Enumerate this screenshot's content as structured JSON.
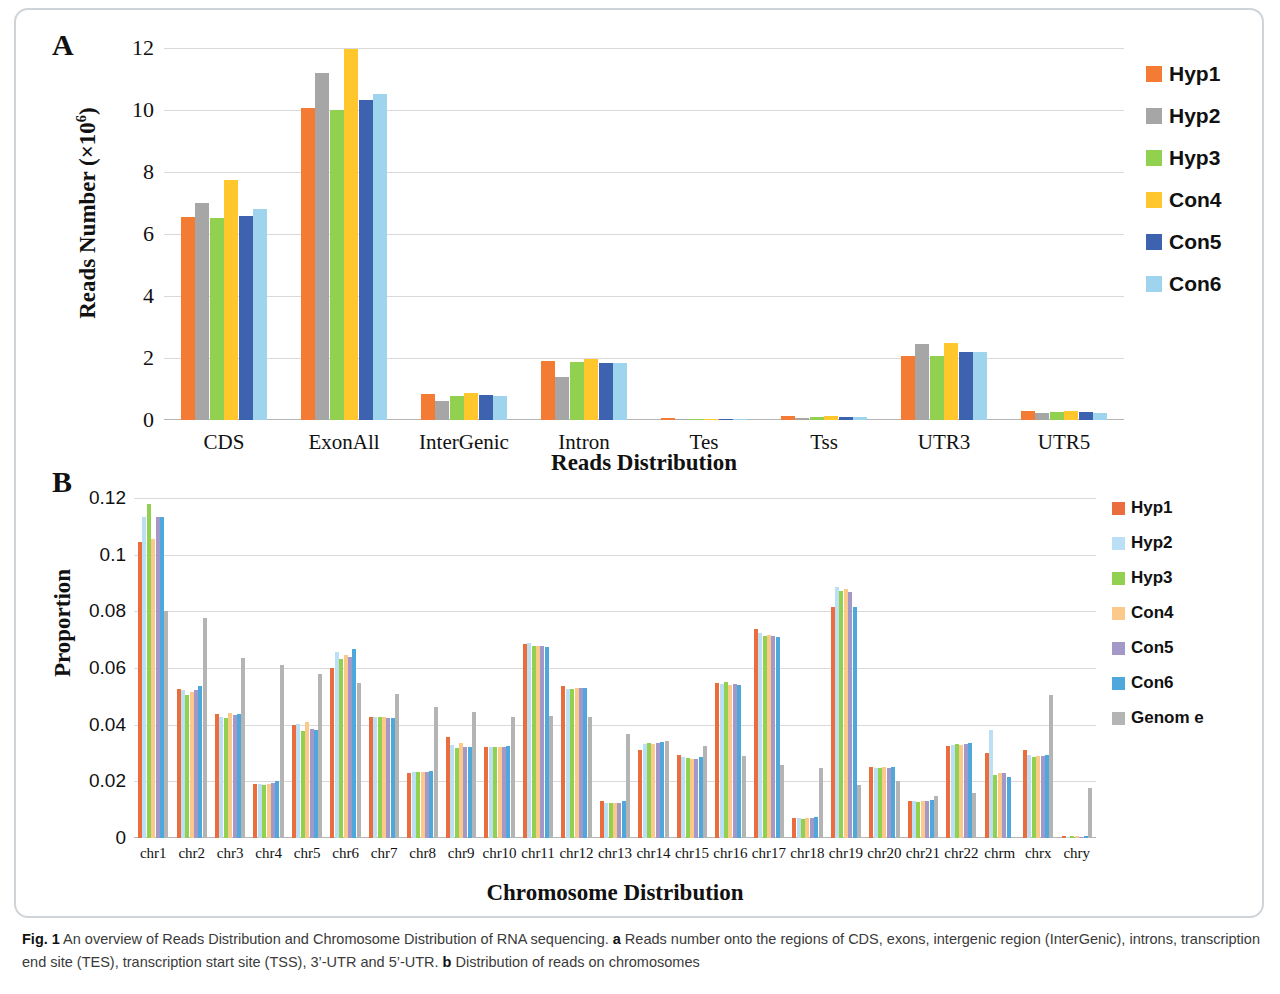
{
  "figure": {
    "panel_a_letter": "A",
    "panel_b_letter": "B",
    "caption_fig_label": "Fig. 1",
    "caption_text_1": " An overview of Reads Distribution and Chromosome Distribution of RNA sequencing. ",
    "caption_bold_a": "a",
    "caption_text_2": " Reads number onto the regions of CDS, exons, intergenic region (InterGenic), introns, transcription end site (TES), transcription start site (TSS), 3’-UTR and 5’-UTR. ",
    "caption_bold_b": "b",
    "caption_text_3": " Distribution of reads on chromosomes"
  },
  "chart_data": [
    {
      "panel": "A",
      "type": "bar",
      "title": "",
      "xlabel": "Reads Distribution",
      "ylabel": "Reads Number (×10⁶)",
      "ylim": [
        0,
        12
      ],
      "yticks": [
        "0",
        "2",
        "4",
        "6",
        "8",
        "10",
        "12"
      ],
      "ytick_values": [
        0,
        2,
        4,
        6,
        8,
        10,
        12
      ],
      "grid": true,
      "legend_position": "right",
      "categories": [
        "CDS",
        "ExonAll",
        "InterGenic",
        "Intron",
        "Tes",
        "Tss",
        "UTR3",
        "UTR5"
      ],
      "series": [
        {
          "name": "Hyp1",
          "color": "#F47B33",
          "values": [
            6.55,
            10.05,
            0.85,
            1.9,
            0.055,
            0.14,
            2.05,
            0.3
          ]
        },
        {
          "name": "Hyp2",
          "color": "#A6A6A6",
          "values": [
            7.0,
            11.2,
            0.62,
            1.4,
            0.035,
            0.08,
            2.45,
            0.23
          ]
        },
        {
          "name": "Hyp3",
          "color": "#92D050",
          "values": [
            6.52,
            10.0,
            0.78,
            1.88,
            0.04,
            0.11,
            2.08,
            0.27
          ]
        },
        {
          "name": "Con4",
          "color": "#FFC72C",
          "values": [
            7.75,
            11.98,
            0.86,
            1.98,
            0.045,
            0.12,
            2.5,
            0.28
          ]
        },
        {
          "name": "Con5",
          "color": "#3C62B0",
          "values": [
            6.58,
            10.32,
            0.8,
            1.85,
            0.045,
            0.11,
            2.2,
            0.27
          ]
        },
        {
          "name": "Con6",
          "color": "#9FD4EE",
          "values": [
            6.8,
            10.52,
            0.77,
            1.85,
            0.045,
            0.11,
            2.2,
            0.24
          ]
        }
      ]
    },
    {
      "panel": "B",
      "type": "bar",
      "title": "",
      "xlabel": "Chromosome Distribution",
      "ylabel": "Proportion",
      "ylim": [
        0,
        0.12
      ],
      "yticks": [
        "0",
        "0.02",
        "0.04",
        "0.06",
        "0.08",
        "0.1",
        "0.12"
      ],
      "ytick_values": [
        0,
        0.02,
        0.04,
        0.06,
        0.08,
        0.1,
        0.12
      ],
      "grid": true,
      "legend_position": "right",
      "categories": [
        "chr1",
        "chr2",
        "chr3",
        "chr4",
        "chr5",
        "chr6",
        "chr7",
        "chr8",
        "chr9",
        "chr10",
        "chr11",
        "chr12",
        "chr13",
        "chr14",
        "chr15",
        "chr16",
        "chr17",
        "chr18",
        "chr19",
        "chr20",
        "chr21",
        "chr22",
        "chrm",
        "chrx",
        "chry"
      ],
      "series": [
        {
          "name": "Hyp1",
          "color": "#EB6C3C",
          "values": [
            0.1045,
            0.0527,
            0.0436,
            0.0191,
            0.04,
            0.0599,
            0.0427,
            0.0231,
            0.0358,
            0.0321,
            0.0683,
            0.0537,
            0.0129,
            0.0312,
            0.0292,
            0.0546,
            0.0738,
            0.0071,
            0.0814,
            0.0251,
            0.0131,
            0.0326,
            0.0301,
            0.0312,
            0.0008
          ]
        },
        {
          "name": "Hyp2",
          "color": "#BBE0F5",
          "values": [
            0.1132,
            0.0523,
            0.0428,
            0.0189,
            0.0404,
            0.0656,
            0.0427,
            0.0233,
            0.033,
            0.0321,
            0.0688,
            0.0525,
            0.0124,
            0.0331,
            0.0286,
            0.0545,
            0.0722,
            0.007,
            0.0886,
            0.0248,
            0.013,
            0.0328,
            0.0381,
            0.0292,
            0.0005
          ]
        },
        {
          "name": "Hyp3",
          "color": "#92D050",
          "values": [
            0.118,
            0.0505,
            0.0425,
            0.0188,
            0.0377,
            0.0633,
            0.0426,
            0.0234,
            0.0319,
            0.032,
            0.0676,
            0.0527,
            0.0122,
            0.0337,
            0.0283,
            0.0552,
            0.0713,
            0.0068,
            0.0871,
            0.0248,
            0.0128,
            0.0332,
            0.0222,
            0.0287,
            0.0006
          ]
        },
        {
          "name": "Con4",
          "color": "#FBC98A",
          "values": [
            0.1055,
            0.0515,
            0.044,
            0.019,
            0.0408,
            0.0646,
            0.0427,
            0.0232,
            0.0334,
            0.0322,
            0.0679,
            0.0531,
            0.0122,
            0.0333,
            0.028,
            0.0541,
            0.0716,
            0.0071,
            0.0879,
            0.025,
            0.0132,
            0.033,
            0.0228,
            0.0288,
            0.0006
          ]
        },
        {
          "name": "Con5",
          "color": "#A398C8",
          "values": [
            0.1133,
            0.0524,
            0.0433,
            0.0194,
            0.0385,
            0.064,
            0.0425,
            0.0234,
            0.0321,
            0.0322,
            0.0679,
            0.0529,
            0.0125,
            0.0337,
            0.028,
            0.0542,
            0.0713,
            0.0071,
            0.0868,
            0.0248,
            0.013,
            0.0331,
            0.0229,
            0.0289,
            0.0005
          ]
        },
        {
          "name": "Con6",
          "color": "#4FA8DC",
          "values": [
            0.1134,
            0.0537,
            0.0438,
            0.0201,
            0.038,
            0.0668,
            0.0425,
            0.0238,
            0.032,
            0.0323,
            0.0673,
            0.053,
            0.013,
            0.034,
            0.0287,
            0.054,
            0.0711,
            0.0075,
            0.0817,
            0.0249,
            0.0134,
            0.0336,
            0.0216,
            0.0294,
            0.0006
          ]
        },
        {
          "name": "Genome",
          "color": "#B4B4B4",
          "values": [
            0.08,
            0.0778,
            0.0636,
            0.061,
            0.058,
            0.0548,
            0.051,
            0.0463,
            0.0444,
            0.0428,
            0.0432,
            0.0427,
            0.0367,
            0.0343,
            0.0326,
            0.0288,
            0.0258,
            0.0248,
            0.0188,
            0.0201,
            0.0147,
            0.0158,
            0.0005,
            0.0503,
            0.0178
          ]
        }
      ]
    }
  ],
  "panel_a": {
    "legend_title": "",
    "legend_items": [
      {
        "label": "Hyp1",
        "color": "#F47B33"
      },
      {
        "label": "Hyp2",
        "color": "#A6A6A6"
      },
      {
        "label": "Hyp3",
        "color": "#92D050"
      },
      {
        "label": "Con4",
        "color": "#FFC72C"
      },
      {
        "label": "Con5",
        "color": "#3C62B0"
      },
      {
        "label": "Con6",
        "color": "#9FD4EE"
      }
    ]
  },
  "panel_b": {
    "legend_items": [
      {
        "label": "Hyp1",
        "color": "#EB6C3C"
      },
      {
        "label": "Hyp2",
        "color": "#BBE0F5"
      },
      {
        "label": "Hyp3",
        "color": "#92D050"
      },
      {
        "label": "Con4",
        "color": "#FBC98A"
      },
      {
        "label": "Con5",
        "color": "#A398C8"
      },
      {
        "label": "Con6",
        "color": "#4FA8DC"
      },
      {
        "label": "Genom e",
        "color": "#B4B4B4"
      }
    ]
  }
}
